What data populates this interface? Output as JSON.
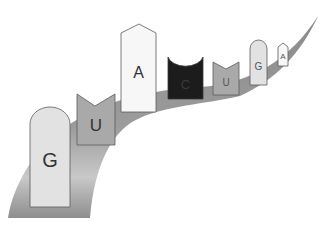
{
  "diagram": {
    "type": "rna-strand",
    "colors": {
      "backbone_dark": "#7d7d7d",
      "backbone_light": "#c4c4c4",
      "outline": "#5a5a5a",
      "G": "#e2e2e2",
      "U": "#a9a9a9",
      "A": "#f7f7f7",
      "C": "#1c1c1c"
    },
    "bases": [
      {
        "letter": "G",
        "shape": "rounded-top",
        "fill": "#e2e2e2",
        "text_color": "#333333"
      },
      {
        "letter": "U",
        "shape": "notched-top",
        "fill": "#a9a9a9",
        "text_color": "#333333"
      },
      {
        "letter": "A",
        "shape": "pointed-top",
        "fill": "#f7f7f7",
        "text_color": "#333333"
      },
      {
        "letter": "C",
        "shape": "concave-top",
        "fill": "#1c1c1c",
        "text_color": "#3a3a3a"
      },
      {
        "letter": "U",
        "shape": "notched-top",
        "fill": "#a9a9a9",
        "text_color": "#555555"
      },
      {
        "letter": "G",
        "shape": "rounded-top",
        "fill": "#e2e2e2",
        "text_color": "#555555"
      },
      {
        "letter": "A",
        "shape": "pointed-top",
        "fill": "#f7f7f7",
        "text_color": "#555555"
      }
    ]
  }
}
